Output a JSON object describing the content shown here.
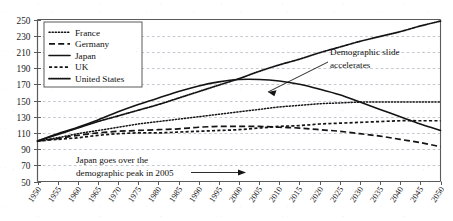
{
  "chart_data": {
    "type": "line",
    "title": "",
    "subtitle": "",
    "xlabel": "",
    "ylabel": "",
    "xlim": [
      1950,
      2050
    ],
    "ylim": [
      50,
      250
    ],
    "ytick_step": 20,
    "xtick_step": 5,
    "grid": true,
    "grid_style": "dashed-horizontal",
    "legend_position": "top-left",
    "x": [
      1950,
      1955,
      1960,
      1965,
      1970,
      1975,
      1980,
      1985,
      1990,
      1995,
      2000,
      2005,
      2010,
      2015,
      2020,
      2025,
      2030,
      2035,
      2040,
      2045,
      2050
    ],
    "ytick_labels": [
      "250",
      "230",
      "210",
      "190",
      "170",
      "150",
      "130",
      "110",
      "90",
      "70",
      "50"
    ],
    "xtick_labels": [
      "1950",
      "1955",
      "1960",
      "1965",
      "1970",
      "1975",
      "1980",
      "1985",
      "1990",
      "1995",
      "2000",
      "2005",
      "2010",
      "2015",
      "2020",
      "2025",
      "2030",
      "2035",
      "2040",
      "2045",
      "2050"
    ],
    "series": [
      {
        "name": "France",
        "style": "dotted",
        "values": [
          100,
          104,
          109,
          113,
          117,
          121,
          124,
          127,
          130,
          133,
          136,
          139,
          142,
          144,
          146,
          147,
          148,
          148,
          148,
          148,
          148
        ]
      },
      {
        "name": "Germany",
        "style": "long-dash",
        "values": [
          100,
          103,
          107,
          110,
          112,
          113,
          114,
          115,
          117,
          118,
          118,
          118,
          117,
          116,
          114,
          112,
          109,
          106,
          102,
          98,
          93
        ]
      },
      {
        "name": "Japan",
        "style": "solid",
        "values": [
          100,
          109,
          117,
          126,
          136,
          145,
          153,
          161,
          168,
          173,
          176,
          176,
          174,
          170,
          164,
          157,
          148,
          139,
          130,
          121,
          113
        ]
      },
      {
        "name": "UK",
        "style": "short-dash",
        "values": [
          100,
          102,
          104,
          107,
          109,
          110,
          110,
          111,
          112,
          113,
          114,
          116,
          118,
          119,
          121,
          122,
          123,
          124,
          125,
          125,
          125
        ]
      },
      {
        "name": "United States",
        "style": "dense-dots",
        "values": [
          100,
          108,
          116,
          124,
          131,
          138,
          145,
          153,
          161,
          169,
          177,
          186,
          194,
          201,
          209,
          216,
          223,
          229,
          235,
          242,
          248
        ]
      }
    ],
    "annotations": [
      {
        "id": "demographic-slide",
        "text_line1": "Demographic slide",
        "text_line2": "accelerates",
        "arrow": "pointer-down-left",
        "points_to_year": 2025,
        "points_to_value": 157
      },
      {
        "id": "japan-peak",
        "text_line1": "Japan goes over the",
        "text_line2": "demographic peak in 2005",
        "arrow": "pointer-right",
        "points_to_year": 2005
      }
    ],
    "colors": {
      "line": "#141414",
      "grid": "#9aa3b0",
      "frame": "#5a5a5a",
      "text": "#111111",
      "background": "#ffffff"
    }
  },
  "legend": {
    "items": [
      {
        "label": "France",
        "style": "dotted"
      },
      {
        "label": "Germany",
        "style": "long-dash"
      },
      {
        "label": "Japan",
        "style": "solid"
      },
      {
        "label": "UK",
        "style": "short-dash"
      },
      {
        "label": "United States",
        "style": "dense-dots"
      }
    ]
  }
}
